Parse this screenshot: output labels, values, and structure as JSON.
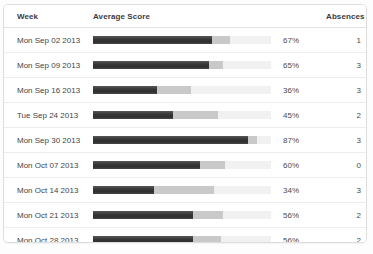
{
  "table": {
    "headers": {
      "week": "Week",
      "average_score": "Average Score",
      "absences": "Absences"
    },
    "rows": [
      {
        "week": "Mon Sep 02 2013",
        "score_label": "67%",
        "absences": "1"
      },
      {
        "week": "Mon Sep 09 2013",
        "score_label": "65%",
        "absences": "3"
      },
      {
        "week": "Mon Sep 16 2013",
        "score_label": "36%",
        "absences": "3"
      },
      {
        "week": "Tue Sep 24 2013",
        "score_label": "45%",
        "absences": "2"
      },
      {
        "week": "Mon Sep 30 2013",
        "score_label": "87%",
        "absences": "3"
      },
      {
        "week": "Mon Oct 07 2013",
        "score_label": "60%",
        "absences": "0"
      },
      {
        "week": "Mon Oct 14 2013",
        "score_label": "34%",
        "absences": "3"
      },
      {
        "week": "Mon Oct 21 2013",
        "score_label": "56%",
        "absences": "2"
      },
      {
        "week": "Mon Oct 28 2013",
        "score_label": "56%",
        "absences": "2"
      }
    ]
  },
  "chart_data": {
    "type": "bar",
    "title": "",
    "xlabel": "Average Score",
    "ylabel": "Week",
    "orientation": "horizontal",
    "grid": false,
    "legend": "none",
    "xlim": [
      0,
      100
    ],
    "categories": [
      "Mon Sep 02 2013",
      "Mon Sep 09 2013",
      "Mon Sep 16 2013",
      "Tue Sep 24 2013",
      "Mon Sep 30 2013",
      "Mon Oct 07 2013",
      "Mon Oct 14 2013",
      "Mon Oct 21 2013",
      "Mon Oct 28 2013"
    ],
    "series": [
      {
        "name": "Average Score",
        "color": "#3c3c3c",
        "values": [
          67,
          65,
          36,
          45,
          87,
          60,
          34,
          56,
          56
        ]
      },
      {
        "name": "Secondary segment",
        "color": "#c9c9c9",
        "values": [
          77,
          73,
          55,
          70,
          92,
          74,
          68,
          73,
          72
        ]
      }
    ],
    "track_color": "#f1f1f1",
    "absences": [
      1,
      3,
      3,
      2,
      3,
      0,
      3,
      2,
      2
    ],
    "value_labels": [
      "67%",
      "65%",
      "36%",
      "45%",
      "87%",
      "60%",
      "34%",
      "56%",
      "56%"
    ]
  },
  "colors": {
    "bar_fill": "#3c3c3c",
    "bar_secondary": "#c9c9c9",
    "bar_track": "#f1f1f1",
    "panel_border": "#dedede",
    "row_divider": "#ededed",
    "text": "#4a4a4a"
  }
}
